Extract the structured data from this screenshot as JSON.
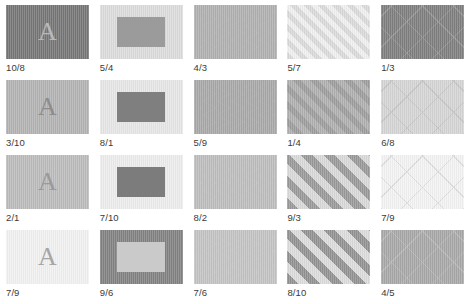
{
  "page": {
    "columns": 5,
    "rows": 4
  },
  "palette": {
    "label_color": "#3a3a3a",
    "page_background": "#ffffff",
    "dark_gray": "#7b7b7b",
    "mid_gray": "#9e9e9e",
    "light_gray": "#d6d6d6",
    "very_light_gray": "#ededed",
    "near_white": "#f5f5f5",
    "stripe_gray": "#9a9a9a",
    "chevron_gray": "#b4b4b4"
  },
  "tiles": [
    {
      "label": "10/8",
      "kind": "letter",
      "glyph": "A",
      "bg": "#767676",
      "fg": "#b9b9b9"
    },
    {
      "label": "5/4",
      "kind": "rect",
      "bg": "#dcdcdc",
      "fg": "#9b9b9b"
    },
    {
      "label": "4/3",
      "kind": "chevron",
      "bg": "#dedede",
      "fg": "#b0b0b0",
      "band": 7,
      "amplitude": 13
    },
    {
      "label": "5/7",
      "kind": "diagonal",
      "bg": "#f0f0f0",
      "fg": "#dadada",
      "band": 5
    },
    {
      "label": "1/3",
      "kind": "lattice",
      "bg": "#7f7f7f",
      "fg": "#949494",
      "band": 22
    },
    {
      "label": "3/10",
      "kind": "letter",
      "glyph": "A",
      "bg": "#b3b3b3",
      "fg": "#8d8d8d"
    },
    {
      "label": "8/1",
      "kind": "rect",
      "bg": "#e6e6e6",
      "fg": "#7f7f7f"
    },
    {
      "label": "5/9",
      "kind": "chevron",
      "bg": "#e2e2e2",
      "fg": "#a8a8a8",
      "band": 7,
      "amplitude": 13
    },
    {
      "label": "1/4",
      "kind": "diagonal",
      "bg": "#9d9d9d",
      "fg": "#b0b0b0",
      "band": 6
    },
    {
      "label": "6/8",
      "kind": "lattice",
      "bg": "#d5d5d5",
      "fg": "#c4c4c4",
      "band": 22
    },
    {
      "label": "2/1",
      "kind": "letter",
      "glyph": "A",
      "bg": "#bcbcbc",
      "fg": "#9a9a9a"
    },
    {
      "label": "7/10",
      "kind": "rect",
      "bg": "#ececec",
      "fg": "#7c7c7c"
    },
    {
      "label": "8/2",
      "kind": "chevron",
      "bg": "#e8e8e8",
      "fg": "#bdbdbd",
      "band": 7,
      "amplitude": 13
    },
    {
      "label": "9/3",
      "kind": "diagonal",
      "bg": "#d9d9d9",
      "fg": "#9a9a9a",
      "band": 8
    },
    {
      "label": "7/9",
      "kind": "lattice",
      "bg": "#f3f3f3",
      "fg": "#dcdcdc",
      "band": 22
    },
    {
      "label": "7/9",
      "kind": "letter",
      "glyph": "A",
      "bg": "#f1f1f1",
      "fg": "#a6a6a6"
    },
    {
      "label": "9/6",
      "kind": "rect",
      "bg": "#828282",
      "fg": "#cacaca"
    },
    {
      "label": "7/6",
      "kind": "chevron",
      "bg": "#ebebeb",
      "fg": "#c3c3c3",
      "band": 7,
      "amplitude": 13
    },
    {
      "label": "8/10",
      "kind": "diagonal",
      "bg": "#dcdcdc",
      "fg": "#939393",
      "band": 8
    },
    {
      "label": "4/5",
      "kind": "lattice",
      "bg": "#a8a8a8",
      "fg": "#b6b6b6",
      "band": 22
    }
  ]
}
